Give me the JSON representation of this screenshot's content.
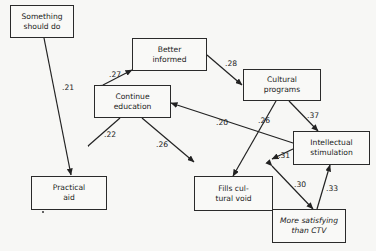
{
  "nodes": {
    "something_should_do": {
      "label": "Something\nshould do"
    },
    "better_informed": {
      "label": "Better\ninformed"
    },
    "continue_education": {
      "label": "Continue\neducation"
    },
    "cultural_programs": {
      "label": "Cultural\nprograms"
    },
    "intellectual_stimulation": {
      "label": "Intellectual\nstimulation"
    },
    "practical_aid": {
      "label": "Practical\naid"
    },
    "fills_cultural_void": {
      "label": "Fills cul-\ntural void"
    },
    "more_satisfying": {
      "label": "More satisfying\nthan CTV"
    }
  },
  "edges": [
    {
      "from": "something_should_do",
      "to": "practical_aid",
      "weight": ".21"
    },
    {
      "from": "continue_education",
      "to": "better_informed",
      "weight": ".27"
    },
    {
      "from": "better_informed",
      "to": "cultural_programs",
      "weight": ".28"
    },
    {
      "from": "continue_education",
      "to": "practical_aid",
      "weight": ".22"
    },
    {
      "from": "continue_education",
      "to": "fills_cultural_void",
      "weight": ".26"
    },
    {
      "from": "intellectual_stimulation",
      "to": "continue_education",
      "weight": ".20"
    },
    {
      "from": "cultural_programs",
      "to": "fills_cultural_void",
      "weight": ".26"
    },
    {
      "from": "cultural_programs",
      "to": "intellectual_stimulation",
      "weight": ".37"
    },
    {
      "from": "intellectual_stimulation",
      "to": "fills_cultural_void",
      "weight": ".31"
    },
    {
      "from": "fills_cultural_void",
      "to": "more_satisfying",
      "weight": ".30"
    },
    {
      "from": "more_satisfying",
      "to": "intellectual_stimulation",
      "weight": ".33"
    }
  ],
  "footnote_marker": "*"
}
